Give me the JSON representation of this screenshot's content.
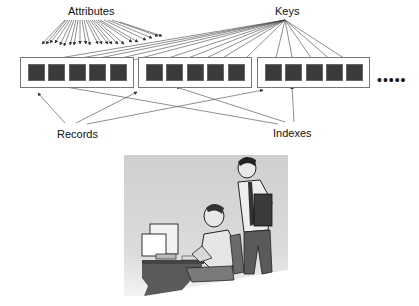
{
  "diagram": {
    "labels": {
      "attributes": "Attributes",
      "keys": "Keys",
      "records": "Records",
      "indexes": "Indexes",
      "ellipsis": "•••••"
    },
    "records": [
      {
        "id": "record-1",
        "attribute_count": 5
      },
      {
        "id": "record-2",
        "attribute_count": 5
      },
      {
        "id": "record-3",
        "attribute_count": 5
      }
    ],
    "colors": {
      "attribute_fill": "#3b3b3b",
      "record_border": "#777777",
      "arrow": "#333333",
      "illustration_bg": "#d4d4d4"
    },
    "illustration": {
      "description": "Two office workers at a computer desk; one seated at a monitor, one standing holding a binder"
    }
  }
}
